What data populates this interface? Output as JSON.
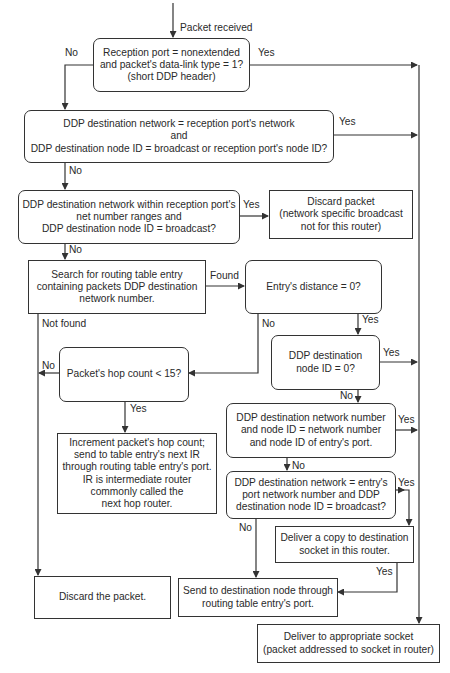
{
  "diagram": {
    "start_label": "Packet received",
    "nodes": {
      "reception_port_check": "Reception port = nonextended\nand packet's data-link type = 1?\n(short DDP header)",
      "dest_network_check": "DDP destination network = reception port's network\nand\nDDP destination node ID = broadcast or reception port's node ID?",
      "net_range_broadcast_check": "DDP destination network within reception port's\nnet number ranges and\nDDP destination node ID = broadcast?",
      "discard_network_broadcast": "Discard packet\n(network specific broadcast\nnot for this router)",
      "search_routing_table": "Search for routing table entry\ncontaining packets DDP destination\nnetwork number.",
      "entry_distance_check": "Entry's distance = 0?",
      "hop_count_check": "Packet's hop count < 15?",
      "dest_node_zero_check": "DDP destination\nnode ID = 0?",
      "increment_hop_count": "Increment packet's hop count;\nsend to table entry's next IR\nthrough routing table entry's port.\nIR is intermediate router\ncommonly called the\nnext hop router.",
      "entry_port_match_check": "DDP destination network number\nand node ID = network number\nand node ID of entry's port.",
      "entry_port_broadcast_check": "DDP destination network = entry's\nport network number and DDP\ndestination node ID = broadcast?",
      "deliver_copy": "Deliver a copy to destination\nsocket in this router.",
      "discard_packet": "Discard the packet.",
      "send_to_dest_node": "Send to destination node through\nrouting table entry's port.",
      "deliver_to_socket": "Deliver to appropriate socket\n(packet addressed to socket in router)"
    },
    "edge_labels": {
      "reception_no": "No",
      "reception_yes": "Yes",
      "dest_network_yes": "Yes",
      "dest_network_no": "No",
      "net_range_yes": "Yes",
      "net_range_no": "No",
      "search_found": "Found",
      "search_not_found": "Not found",
      "distance_no": "No",
      "distance_yes": "Yes",
      "hop_no": "No",
      "hop_yes": "Yes",
      "node_zero_yes": "Yes",
      "node_zero_no": "No",
      "port_match_yes": "Yes",
      "port_match_no": "No",
      "port_broadcast_yes": "Yes",
      "port_broadcast_no": "No",
      "deliver_copy_yes": "Yes"
    },
    "colors": {
      "line": "#333333",
      "text": "#2a2a2a",
      "background": "#ffffff"
    }
  }
}
